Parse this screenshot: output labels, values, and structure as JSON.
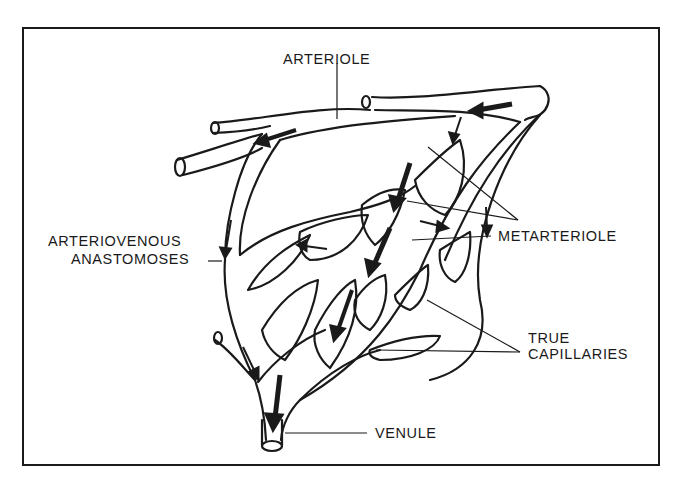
{
  "diagram": {
    "type": "anatomical-illustration",
    "colors": {
      "ink": "#1a1a1a",
      "background": "#ffffff"
    },
    "labels": {
      "arteriole": "ARTERIOLE",
      "av_anastomoses_line1": "ARTERIOVENOUS",
      "av_anastomoses_line2": "ANASTOMOSES",
      "metarteriole": "METARTERIOLE",
      "true_capillaries_line1": "TRUE",
      "true_capillaries_line2": "CAPILLARIES",
      "venule": "VENULE"
    }
  }
}
